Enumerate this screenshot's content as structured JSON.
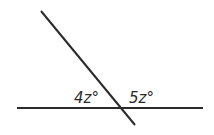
{
  "diagram": {
    "type": "intersecting-lines",
    "lines": [
      {
        "name": "horizontal-line",
        "x1": 17,
        "y1": 108,
        "x2": 203,
        "y2": 108
      },
      {
        "name": "transversal-line",
        "x1": 41,
        "y1": 11,
        "x2": 135,
        "y2": 125
      }
    ],
    "angles": [
      {
        "label": "4z°",
        "position": "left"
      },
      {
        "label": "5z°",
        "position": "right"
      }
    ],
    "colors": {
      "line": "#2a2a2a",
      "background": "#ffffff"
    }
  }
}
